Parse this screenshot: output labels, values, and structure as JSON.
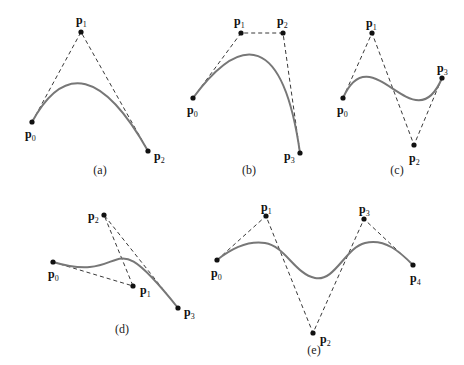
{
  "panels": [
    {
      "caption": "(a)",
      "points": [
        {
          "name": "p",
          "sub": "0",
          "x": 32,
          "y": 122,
          "lx": 25,
          "ly": 138
        },
        {
          "name": "p",
          "sub": "1",
          "x": 81,
          "y": 32,
          "lx": 76,
          "ly": 24
        },
        {
          "name": "p",
          "sub": "2",
          "x": 148,
          "y": 151,
          "lx": 154,
          "ly": 160
        }
      ],
      "curve": "M32,122 Q81,32 148,151",
      "caption_x": 100,
      "caption_y": 174
    },
    {
      "caption": "(b)",
      "points": [
        {
          "name": "p",
          "sub": "0",
          "x": 193,
          "y": 98,
          "lx": 187,
          "ly": 114
        },
        {
          "name": "p",
          "sub": "1",
          "x": 241,
          "y": 33,
          "lx": 234,
          "ly": 25
        },
        {
          "name": "p",
          "sub": "2",
          "x": 283,
          "y": 33,
          "lx": 277,
          "ly": 25
        },
        {
          "name": "p",
          "sub": "3",
          "x": 300,
          "y": 153,
          "lx": 284,
          "ly": 160
        }
      ],
      "curve": "M193,98 C241,33 283,33 300,153",
      "caption_x": 249,
      "caption_y": 174
    },
    {
      "caption": "(c)",
      "points": [
        {
          "name": "p",
          "sub": "0",
          "x": 343,
          "y": 98,
          "lx": 337,
          "ly": 114
        },
        {
          "name": "p",
          "sub": "1",
          "x": 372,
          "y": 33,
          "lx": 366,
          "ly": 27
        },
        {
          "name": "p",
          "sub": "2",
          "x": 414,
          "y": 145,
          "lx": 409,
          "ly": 162
        },
        {
          "name": "p",
          "sub": "3",
          "x": 442,
          "y": 78,
          "lx": 437,
          "ly": 72
        }
      ],
      "curve": "M343,98 C372,33 414,145 442,78",
      "caption_x": 397,
      "caption_y": 174
    },
    {
      "caption": "(d)",
      "points": [
        {
          "name": "p",
          "sub": "0",
          "x": 53,
          "y": 262,
          "lx": 48,
          "ly": 278
        },
        {
          "name": "p",
          "sub": "1",
          "x": 133,
          "y": 286,
          "lx": 140,
          "ly": 294
        },
        {
          "name": "p",
          "sub": "2",
          "x": 104,
          "y": 215,
          "lx": 88,
          "ly": 220
        },
        {
          "name": "p",
          "sub": "3",
          "x": 178,
          "y": 308,
          "lx": 184,
          "ly": 316
        }
      ],
      "curve": "M53,262 C133,286 104,215 178,308",
      "caption_x": 122,
      "caption_y": 333
    },
    {
      "caption": "(e)",
      "points": [
        {
          "name": "p",
          "sub": "0",
          "x": 217,
          "y": 260,
          "lx": 211,
          "ly": 277
        },
        {
          "name": "p",
          "sub": "1",
          "x": 266,
          "y": 216,
          "lx": 261,
          "ly": 211
        },
        {
          "name": "p",
          "sub": "2",
          "x": 313,
          "y": 333,
          "lx": 320,
          "ly": 343
        },
        {
          "name": "p",
          "sub": "3",
          "x": 364,
          "y": 219,
          "lx": 359,
          "ly": 213
        },
        {
          "name": "p",
          "sub": "4",
          "x": 413,
          "y": 265,
          "lx": 410,
          "ly": 282
        }
      ],
      "curve": "M217,260 C227,252 245,240 265,243 C285,246 295,274 315,278 C335,282 345,248 365,243 C385,238 400,252 413,265",
      "caption_x": 314,
      "caption_y": 354
    }
  ]
}
